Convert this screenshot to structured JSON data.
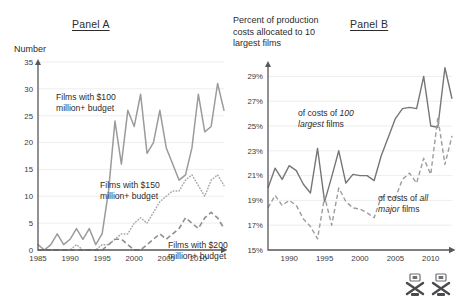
{
  "panel_a": {
    "title": "Panel A",
    "axis_caption": "Number"
  },
  "panel_b": {
    "title": "Panel B",
    "axis_caption": "Percent of production costs allocated to 10 largest films"
  },
  "annotations": {
    "a1_line1": "Films with $100",
    "a1_line2": "million+ budget",
    "a2_line1": "Films with $150",
    "a2_line2": "million+ budget",
    "a3_line1": "Films with $200",
    "a3_line2": "million+ budget",
    "b1_line1_pre": "of costs of ",
    "b1_line1_em": "100",
    "b1_line2_em": "largest",
    "b1_line2_post": " films",
    "b2_line1_pre": "of costs of ",
    "b2_line1_em": "all",
    "b2_line2_em": "major",
    "b2_line2_post": " films"
  },
  "colors": {
    "ink": "#2c2c2c",
    "axis": "#58585c",
    "grid": "#e9e9ec",
    "series_light": "#9b9b9e",
    "series_dark": "#76767a"
  },
  "watermark": {
    "icon_1": "crossed-film-reel-icon",
    "icon_2": "crossed-film-reel-icon"
  },
  "chart_data": [
    {
      "type": "line",
      "panel": "Panel A",
      "title": "Panel A",
      "ylabel": "Number",
      "xlabel": "",
      "ylim": [
        0,
        35
      ],
      "xlim": [
        1985,
        2014
      ],
      "yticks": [
        0,
        5,
        10,
        15,
        20,
        25,
        30,
        35
      ],
      "ytick_labels": [
        "0",
        "5",
        "10",
        "15",
        "20",
        "25",
        "30",
        "35"
      ],
      "xticks": [
        1985,
        1990,
        1995,
        2000,
        2005,
        2010
      ],
      "xtick_labels": [
        "1985",
        "1990",
        "1995",
        "2000",
        "2005",
        "2010"
      ],
      "grid": true,
      "legend_position": "inline-annotations",
      "x": [
        1985,
        1986,
        1987,
        1988,
        1989,
        1990,
        1991,
        1992,
        1993,
        1994,
        1995,
        1996,
        1997,
        1998,
        1999,
        2000,
        2001,
        2002,
        2003,
        2004,
        2005,
        2006,
        2007,
        2008,
        2009,
        2010,
        2011,
        2012,
        2013,
        2014
      ],
      "series": [
        {
          "name": "Films with $100 million+ budget",
          "style": "solid",
          "values": [
            1,
            0,
            1,
            3,
            1,
            2,
            4,
            2,
            4,
            1,
            3,
            11,
            24,
            16,
            26,
            23,
            29,
            18,
            20,
            26,
            19,
            16,
            13,
            14,
            19,
            29,
            22,
            23,
            31,
            26
          ]
        },
        {
          "name": "Films with $150 million+ budget",
          "style": "dotted",
          "values": [
            0,
            0,
            0,
            0,
            0,
            0,
            1,
            0,
            0,
            0,
            1,
            1,
            2,
            3,
            3,
            5,
            6,
            5,
            7,
            9,
            10,
            11,
            11,
            13,
            14,
            12,
            10,
            13,
            14,
            12
          ]
        },
        {
          "name": "Films with $200 million+ budget",
          "style": "dashed",
          "values": [
            0,
            0,
            0,
            0,
            0,
            0,
            0,
            0,
            0,
            0,
            0,
            1,
            2,
            2,
            1,
            0,
            0,
            1,
            2,
            3,
            2,
            3,
            4,
            6,
            5,
            4,
            6,
            7,
            6,
            4
          ]
        }
      ]
    },
    {
      "type": "line",
      "panel": "Panel B",
      "title": "Panel B",
      "ylabel": "Percent of production costs allocated to 10 largest films",
      "xlabel": "",
      "ylim": [
        15,
        30
      ],
      "xlim": [
        1987,
        2013
      ],
      "yticks": [
        15,
        17,
        19,
        21,
        23,
        25,
        27,
        29
      ],
      "ytick_labels": [
        "15%",
        "17%",
        "19%",
        "21%",
        "23%",
        "25%",
        "27%",
        "29%"
      ],
      "xticks": [
        1990,
        1995,
        2000,
        2005,
        2010
      ],
      "xtick_labels": [
        "1990",
        "1995",
        "2000",
        "2005",
        "2010"
      ],
      "grid": true,
      "legend_position": "inline-annotations",
      "x": [
        1987,
        1988,
        1989,
        1990,
        1991,
        1992,
        1993,
        1994,
        1995,
        1996,
        1997,
        1998,
        1999,
        2000,
        2001,
        2002,
        2003,
        2004,
        2005,
        2006,
        2007,
        2008,
        2009,
        2010,
        2011,
        2012,
        2013
      ],
      "series": [
        {
          "name": "of costs of 100 largest films",
          "style": "solid",
          "values": [
            20.0,
            21.6,
            20.7,
            21.8,
            21.4,
            20.3,
            19.6,
            23.2,
            18.9,
            20.9,
            23.0,
            20.4,
            21.1,
            21.0,
            21.0,
            20.6,
            22.6,
            24.1,
            25.6,
            26.4,
            26.5,
            26.4,
            29.0,
            25.0,
            24.9,
            29.7,
            27.2
          ]
        },
        {
          "name": "of costs of all major films",
          "style": "dashed",
          "values": [
            18.4,
            19.4,
            18.6,
            19.0,
            18.6,
            17.5,
            16.9,
            15.9,
            19.3,
            17.0,
            20.0,
            18.9,
            18.4,
            18.3,
            18.0,
            17.6,
            19.3,
            19.3,
            19.2,
            20.7,
            21.2,
            20.4,
            22.4,
            21.1,
            25.7,
            21.9,
            24.2
          ]
        }
      ]
    }
  ]
}
